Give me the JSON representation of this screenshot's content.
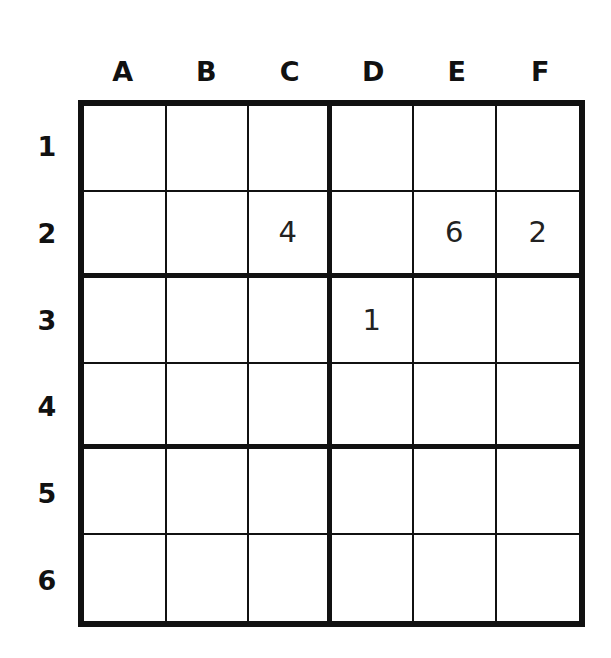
{
  "puzzle": {
    "type": "6x6 sudoku",
    "box_shape": "2 rows x 3 columns",
    "columns": [
      "A",
      "B",
      "C",
      "D",
      "E",
      "F"
    ],
    "rows": [
      "1",
      "2",
      "3",
      "4",
      "5",
      "6"
    ],
    "grid": [
      [
        "",
        "",
        "",
        "",
        "",
        ""
      ],
      [
        "",
        "",
        "4",
        "",
        "6",
        "2"
      ],
      [
        "",
        "",
        "",
        "1",
        "",
        ""
      ],
      [
        "",
        "",
        "",
        "",
        "",
        ""
      ],
      [
        "",
        "",
        "",
        "",
        "",
        ""
      ],
      [
        "",
        "",
        "",
        "",
        "",
        ""
      ]
    ],
    "givens": [
      {
        "cell": "C2",
        "value": "4"
      },
      {
        "cell": "E2",
        "value": "6"
      },
      {
        "cell": "F2",
        "value": "2"
      },
      {
        "cell": "D3",
        "value": "1"
      }
    ]
  },
  "colors": {
    "grid_line": "#111111",
    "background": "#ffffff",
    "digit": "#222222"
  }
}
